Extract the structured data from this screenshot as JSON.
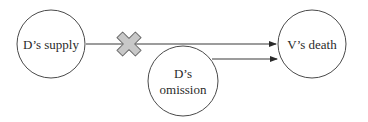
{
  "diagram": {
    "nodes": [
      {
        "id": "supply",
        "lines": [
          "D’s supply"
        ]
      },
      {
        "id": "omission",
        "lines": [
          "D’s",
          "omission"
        ]
      },
      {
        "id": "death",
        "lines": [
          "V’s death"
        ]
      }
    ],
    "edges": [
      {
        "from": "supply",
        "to": "death",
        "blocked": true,
        "marker": "x-cross-icon"
      },
      {
        "from": "omission",
        "to": "death",
        "blocked": false
      }
    ],
    "colors": {
      "stroke": "#3a3a3a",
      "cross_fill": "#c8c8c8",
      "cross_stroke": "#6a6a6a",
      "background": "#ffffff"
    }
  }
}
